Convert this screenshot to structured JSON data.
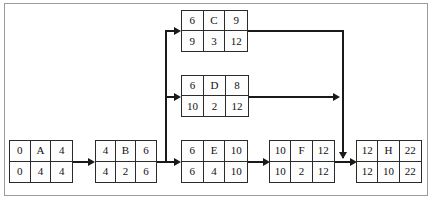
{
  "diagram": {
    "type": "activity-on-node-network",
    "border_color": "#9a9a9a",
    "line_color": "#1a1a1a",
    "nodes": [
      {
        "id": "A",
        "label": "A",
        "early_start": "0",
        "early_finish": "4",
        "late_start": "0",
        "duration": "4",
        "late_finish": "4"
      },
      {
        "id": "B",
        "label": "B",
        "early_start": "4",
        "early_finish": "6",
        "late_start": "4",
        "duration": "2",
        "late_finish": "6"
      },
      {
        "id": "C",
        "label": "C",
        "early_start": "6",
        "early_finish": "9",
        "late_start": "9",
        "duration": "3",
        "late_finish": "12"
      },
      {
        "id": "D",
        "label": "D",
        "early_start": "6",
        "early_finish": "8",
        "late_start": "10",
        "duration": "2",
        "late_finish": "12"
      },
      {
        "id": "E",
        "label": "E",
        "early_start": "6",
        "early_finish": "10",
        "late_start": "6",
        "duration": "4",
        "late_finish": "10"
      },
      {
        "id": "F",
        "label": "F",
        "early_start": "10",
        "early_finish": "12",
        "late_start": "10",
        "duration": "2",
        "late_finish": "12"
      },
      {
        "id": "H",
        "label": "H",
        "early_start": "12",
        "early_finish": "22",
        "late_start": "12",
        "duration": "10",
        "late_finish": "22"
      }
    ],
    "edges": [
      {
        "from": "A",
        "to": "B"
      },
      {
        "from": "B",
        "to": "C"
      },
      {
        "from": "B",
        "to": "D"
      },
      {
        "from": "B",
        "to": "E"
      },
      {
        "from": "C",
        "to": "H"
      },
      {
        "from": "D",
        "to": "H"
      },
      {
        "from": "E",
        "to": "F"
      },
      {
        "from": "F",
        "to": "H"
      }
    ]
  }
}
